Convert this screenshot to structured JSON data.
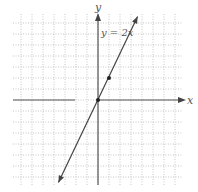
{
  "chart_data": {
    "type": "line",
    "title": "",
    "equation_label": "y = 2x",
    "xlabel": "x",
    "ylabel": "y",
    "xlim": [
      -8,
      8
    ],
    "ylim": [
      -8,
      8
    ],
    "grid": true,
    "series": [
      {
        "name": "y = 2x",
        "x": [
          -3.6,
          3.6
        ],
        "values": [
          -7.5,
          7.6
        ]
      }
    ],
    "points": [
      {
        "x": 0,
        "y": 0
      },
      {
        "x": 1,
        "y": 2
      }
    ]
  },
  "labels": {
    "x_axis": "x",
    "y_axis": "y",
    "equation": "y = 2x"
  },
  "colors": {
    "axis": "#555555",
    "line": "#444444",
    "grid": "#b0b0b0",
    "point": "#222222"
  }
}
